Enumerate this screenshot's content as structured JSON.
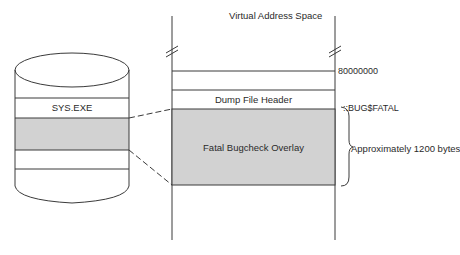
{
  "diagram": {
    "title": "Virtual Address Space",
    "address_space": {
      "base_address_label": "80000000",
      "regions": [
        {
          "label": "",
          "fill": "#ffffff"
        },
        {
          "label": "Dump File Header",
          "fill": "#ffffff"
        },
        {
          "label": "Fatal Bugcheck Overlay",
          "fill": "#d2d2d2"
        }
      ],
      "symbol_label": "::BUG$FATAL",
      "size_annotation": "Approximately 1200 bytes"
    },
    "disk_file": {
      "label": "SYS.EXE",
      "shaded_section_fill": "#d2d2d2"
    },
    "colors": {
      "line": "#3a3a3a",
      "shade": "#d2d2d2",
      "text": "#2a2a2a"
    }
  }
}
